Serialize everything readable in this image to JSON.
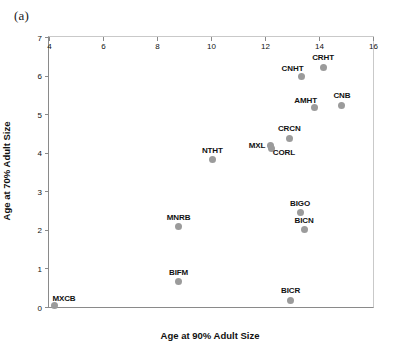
{
  "figure": {
    "panel_label": "(a)",
    "marker_color": "#9b9b9b",
    "axis_color": "#8a8a8a",
    "text_color": "#111111"
  },
  "chart_data": {
    "type": "scatter",
    "title": "",
    "xlabel": "Age at 90% Adult Size",
    "ylabel": "Age at 70% Adult Size",
    "xlim": [
      4,
      16
    ],
    "ylim": [
      0,
      7
    ],
    "xticks": [
      4,
      6,
      8,
      10,
      12,
      14,
      16
    ],
    "yticks": [
      0,
      1,
      2,
      3,
      4,
      5,
      6,
      7
    ],
    "xtick_labels": [
      "4",
      "6",
      "8",
      "10",
      "12",
      "14",
      "16"
    ],
    "ytick_labels": [
      "0",
      "1",
      "2",
      "3",
      "4",
      "5",
      "6",
      "7"
    ],
    "grid": false,
    "legend": "none",
    "points": [
      {
        "label": "MXCB",
        "x": 4.2,
        "y": 0.03,
        "label_pos": "above-right"
      },
      {
        "label": "BIFM",
        "x": 8.8,
        "y": 0.65,
        "label_pos": "above"
      },
      {
        "label": "MNRB",
        "x": 8.8,
        "y": 2.08,
        "label_pos": "above"
      },
      {
        "label": "NTHT",
        "x": 10.05,
        "y": 3.82,
        "label_pos": "above"
      },
      {
        "label": "MXL",
        "x": 12.2,
        "y": 4.2,
        "label_pos": "left"
      },
      {
        "label": "CORL",
        "x": 12.25,
        "y": 4.12,
        "label_pos": "below-right"
      },
      {
        "label": "CRCN",
        "x": 12.9,
        "y": 4.38,
        "label_pos": "above"
      },
      {
        "label": "BICR",
        "x": 12.95,
        "y": 0.17,
        "label_pos": "above"
      },
      {
        "label": "BIGO",
        "x": 13.3,
        "y": 2.45,
        "label_pos": "above"
      },
      {
        "label": "BICN",
        "x": 13.45,
        "y": 2.0,
        "label_pos": "above"
      },
      {
        "label": "CNHT",
        "x": 13.35,
        "y": 5.98,
        "label_pos": "above-left"
      },
      {
        "label": "AMHT",
        "x": 13.85,
        "y": 5.17,
        "label_pos": "above-left"
      },
      {
        "label": "CRHT",
        "x": 14.15,
        "y": 6.22,
        "label_pos": "above"
      },
      {
        "label": "CNB",
        "x": 14.85,
        "y": 5.23,
        "label_pos": "above"
      }
    ]
  }
}
